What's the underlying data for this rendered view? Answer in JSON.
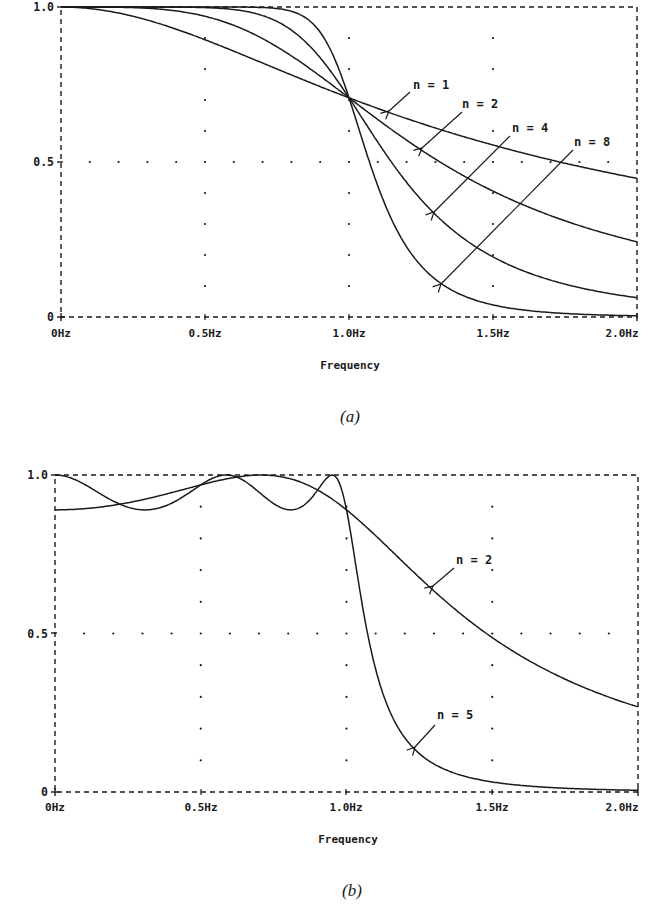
{
  "chart_data": [
    {
      "id": "a",
      "type": "line",
      "caption": "(a)",
      "title": "",
      "xlabel": "Frequency",
      "ylabel": "",
      "xlim": [
        0,
        2.0
      ],
      "ylim": [
        0,
        1.0
      ],
      "x_ticks": [
        "0Hz",
        "0.5Hz",
        "1.0Hz",
        "1.5Hz",
        "2.0Hz"
      ],
      "y_ticks": [
        "0",
        "0.5",
        "1.0"
      ],
      "grid": "dotted",
      "response": "butterworth",
      "x": [
        0,
        0.25,
        0.5,
        0.75,
        1.0,
        1.25,
        1.5,
        1.75,
        2.0
      ],
      "series": [
        {
          "name": "n = 1",
          "order": 1,
          "values": [
            1.0,
            0.97,
            0.894,
            0.8,
            0.707,
            0.625,
            0.555,
            0.496,
            0.447
          ]
        },
        {
          "name": "n = 2",
          "order": 2,
          "values": [
            1.0,
            0.998,
            0.97,
            0.872,
            0.707,
            0.539,
            0.406,
            0.31,
            0.243
          ]
        },
        {
          "name": "n = 4",
          "order": 4,
          "values": [
            1.0,
            1.0,
            0.998,
            0.953,
            0.707,
            0.379,
            0.194,
            0.106,
            0.062
          ]
        },
        {
          "name": "n = 8",
          "order": 8,
          "values": [
            1.0,
            1.0,
            1.0,
            0.995,
            0.707,
            0.166,
            0.039,
            0.011,
            0.004
          ]
        }
      ],
      "annotations": [
        "n = 1",
        "n = 2",
        "n = 4",
        "n = 8"
      ]
    },
    {
      "id": "b",
      "type": "line",
      "caption": "(b)",
      "title": "",
      "xlabel": "Frequency",
      "ylabel": "",
      "xlim": [
        0,
        2.0
      ],
      "ylim": [
        0,
        1.0
      ],
      "x_ticks": [
        "0Hz",
        "0.5Hz",
        "1.0Hz",
        "1.5Hz",
        "2.0Hz"
      ],
      "y_ticks": [
        "0",
        "0.5",
        "1.0"
      ],
      "grid": "dotted",
      "response": "chebyshev",
      "ripple_min": 0.89,
      "x": [
        0,
        0.25,
        0.5,
        0.75,
        1.0,
        1.25,
        1.5,
        1.75,
        2.0
      ],
      "series": [
        {
          "name": "n = 2",
          "order": 2,
          "values": [
            0.89,
            0.9,
            0.94,
            0.99,
            0.89,
            0.68,
            0.5,
            0.37,
            0.28
          ]
        },
        {
          "name": "n = 5",
          "order": 5,
          "values": [
            1.0,
            0.91,
            0.96,
            0.9,
            0.89,
            0.13,
            0.04,
            0.015,
            0.007
          ]
        }
      ],
      "annotations": [
        "n = 2",
        "n = 5"
      ]
    }
  ],
  "charts": {
    "a": {
      "caption": "(a)",
      "xlabel": "Frequency",
      "y_ticks": {
        "top": "1.0",
        "mid": "0.5",
        "bottom": "0"
      },
      "x_ticks": {
        "t0": "0Hz",
        "t1": "0.5Hz",
        "t2": "1.0Hz",
        "t3": "1.5Hz",
        "t4": "2.0Hz"
      },
      "labels": {
        "n1": "n = 1",
        "n2": "n = 2",
        "n4": "n = 4",
        "n8": "n = 8"
      }
    },
    "b": {
      "caption": "(b)",
      "xlabel": "Frequency",
      "y_ticks": {
        "top": "1.0",
        "mid": "0.5",
        "bottom": "0"
      },
      "x_ticks": {
        "t0": "0Hz",
        "t1": "0.5Hz",
        "t2": "1.0Hz",
        "t3": "1.5Hz",
        "t4": "2.0Hz"
      },
      "labels": {
        "n2": "n = 2",
        "n5": "n = 5"
      }
    }
  },
  "colors": {
    "ink": "#1a1a1a",
    "background": "#ffffff"
  }
}
